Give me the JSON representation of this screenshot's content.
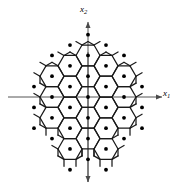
{
  "figure": {
    "kind": "hexagonal-lattice-diagram",
    "background_color": "#ffffff",
    "line_color": "#1a1a1a",
    "dot_color": "#000000",
    "axis_color": "#555555",
    "width": 180,
    "height": 192
  },
  "axes": {
    "origin": {
      "x": 88,
      "y": 97
    },
    "horizontal": {
      "name": "x1",
      "label_text": "x",
      "label_sub": "1",
      "x_start": 8,
      "x_end": 162,
      "y": 97,
      "arrow_at": "end"
    },
    "vertical": {
      "name": "x2",
      "label_text": "x",
      "label_sub": "2",
      "y_start": 22,
      "y_end": 182,
      "x": 88,
      "arrow_at": "both"
    }
  },
  "chart_data": {
    "type": "scatter",
    "title": "",
    "xlabel": "x1",
    "ylabel": "x2",
    "hex_geometry": {
      "orientation": "flat-top",
      "circumradius": 12,
      "inradius": 10.39,
      "col_spacing": 18,
      "row_spacing": 20.78,
      "origin_x": 88,
      "origin_y": 97
    },
    "cells": [
      {
        "col": -1,
        "row": -2
      },
      {
        "col": 0,
        "row": -2
      },
      {
        "col": 1,
        "row": -2
      },
      {
        "col": -2,
        "row": -1
      },
      {
        "col": -1,
        "row": -1
      },
      {
        "col": 0,
        "row": -1
      },
      {
        "col": 1,
        "row": -1
      },
      {
        "col": 2,
        "row": -1
      },
      {
        "col": -2,
        "row": 0
      },
      {
        "col": -1,
        "row": 0
      },
      {
        "col": 0,
        "row": 0
      },
      {
        "col": 1,
        "row": 0
      },
      {
        "col": 2,
        "row": 0
      },
      {
        "col": -2,
        "row": 1
      },
      {
        "col": -1,
        "row": 1
      },
      {
        "col": 0,
        "row": 1
      },
      {
        "col": 1,
        "row": 1
      },
      {
        "col": 2,
        "row": 1
      },
      {
        "col": -1,
        "row": 2
      },
      {
        "col": 0,
        "row": 2
      },
      {
        "col": 1,
        "row": 2
      }
    ],
    "outer_points": [
      {
        "col": -2,
        "row": -2
      },
      {
        "col": 2,
        "row": -2
      },
      {
        "col": -1,
        "row": -3
      },
      {
        "col": 0,
        "row": -3
      },
      {
        "col": 1,
        "row": -3
      },
      {
        "col": -3,
        "row": -1
      },
      {
        "col": 3,
        "row": -1
      },
      {
        "col": -3,
        "row": 0
      },
      {
        "col": 3,
        "row": 0
      },
      {
        "col": -3,
        "row": 1
      },
      {
        "col": 3,
        "row": 1
      },
      {
        "col": -2,
        "row": 2
      },
      {
        "col": 2,
        "row": 2
      },
      {
        "col": -1,
        "row": 3
      },
      {
        "col": 0,
        "row": 3
      },
      {
        "col": 1,
        "row": 3
      }
    ],
    "dot_radius": 1.9,
    "stub_length": 7
  }
}
